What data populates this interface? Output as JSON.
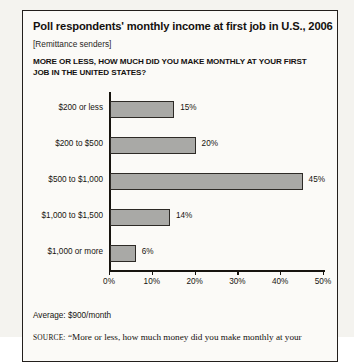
{
  "title": "Poll respondents' monthly income at first job in U.S., 2006",
  "subtitle": "[Remittance senders]",
  "question": "MORE OR LESS, HOW MUCH DID YOU MAKE MONTHLY AT YOUR FIRST JOB IN THE UNITED STATES?",
  "average_note": "Average: $900/month",
  "source": {
    "label": "SOURCE:",
    "text": "“More or less, how much money did you make monthly at your"
  },
  "colors": {
    "bar_fill": "#a9a9a6",
    "bar_stroke": "#2d2a26",
    "axis": "#17140f",
    "frame": "#231f1c",
    "page_background": "#f4f3ef",
    "panel_background": "#fbfaf7",
    "text": "#16130f"
  },
  "chart_data": {
    "type": "bar",
    "orientation": "horizontal",
    "title": "Poll respondents' monthly income at first job in U.S., 2006",
    "subtitle": "[Remittance senders]",
    "xlabel": "",
    "ylabel": "",
    "xlim": [
      0,
      50
    ],
    "grid": false,
    "legend": false,
    "categories": [
      "$200 or less",
      "$200 to $500",
      "$500 to $1,000",
      "$1,000 to $1,500",
      "$1,000 or more"
    ],
    "values": [
      15,
      20,
      45,
      14,
      6
    ],
    "value_labels": [
      "15%",
      "20%",
      "45%",
      "14%",
      "6%"
    ],
    "xticks": [
      0,
      10,
      20,
      30,
      40,
      50
    ],
    "xtick_labels": [
      "0%",
      "10%",
      "20%",
      "30%",
      "40%",
      "50%"
    ],
    "annotation": "Average: $900/month"
  }
}
